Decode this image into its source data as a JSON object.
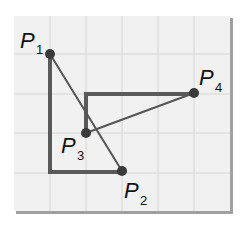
{
  "diagram": {
    "colors": {
      "panel": "#f1f1f1",
      "grid": "#d6d6d6",
      "shadow": "#9a9a9a",
      "line": "#555555",
      "point": "#3a3a3a"
    },
    "grid": {
      "x_lines": [
        50,
        86,
        122,
        158,
        194
      ],
      "y_lines": [
        54,
        94,
        133,
        173
      ]
    },
    "points": [
      {
        "id": "P1",
        "letter": "P",
        "sub": "1",
        "x": 50,
        "y": 54
      },
      {
        "id": "P2",
        "letter": "P",
        "sub": "2",
        "x": 122,
        "y": 171
      },
      {
        "id": "P3",
        "letter": "P",
        "sub": "3",
        "x": 86,
        "y": 133
      },
      {
        "id": "P4",
        "letter": "P",
        "sub": "4",
        "x": 194,
        "y": 93
      }
    ],
    "paths": [
      {
        "from": "P1",
        "to": "P2",
        "style": "thick-elbow"
      },
      {
        "from": "P1",
        "to": "P2",
        "style": "thin-straight"
      },
      {
        "from": "P3",
        "to": "P4",
        "style": "thick-elbow"
      },
      {
        "from": "P3",
        "to": "P4",
        "style": "thin-straight"
      }
    ]
  }
}
